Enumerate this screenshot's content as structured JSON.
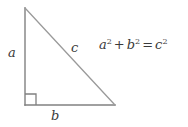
{
  "figure": {
    "type": "geometry-diagram",
    "background_color": "#ffffff",
    "stroke_color": "#808080",
    "text_color": "#3a3a3a"
  },
  "triangle": {
    "vertices": {
      "apex": {
        "x": 25,
        "y": 8
      },
      "bottom_left": {
        "x": 25,
        "y": 105
      },
      "bottom_right": {
        "x": 115,
        "y": 105
      }
    },
    "right_angle_marker": {
      "present": true,
      "corner": "bottom-left",
      "size": 11
    }
  },
  "labels": {
    "leg_vertical": "a",
    "hypotenuse": "c",
    "leg_horizontal": "b"
  },
  "equation": {
    "full_text": "a² + b² = c²",
    "terms": {
      "a_base": "a",
      "a_exp": "2",
      "plus": "+",
      "b_base": "b",
      "b_exp": "2",
      "equals": "=",
      "c_base": "c",
      "c_exp": "2"
    }
  }
}
